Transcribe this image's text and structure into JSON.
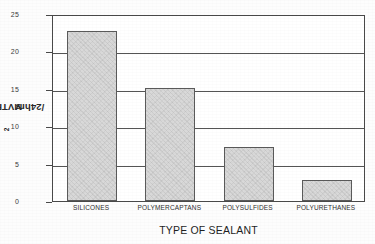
{
  "chart_data": {
    "type": "bar",
    "title": "",
    "subtitle": "",
    "xlabel": "TYPE OF SEALANT",
    "ylabel": "MVTR g/m2/24hrs",
    "ylabel_parts": {
      "main": "MVTR g/m",
      "superscript": "2",
      "tail": "/24hrs"
    },
    "categories": [
      "SILICONES",
      "POLYMERCAPTANS",
      "POLYSULFIDES",
      "POLYURETHANES"
    ],
    "values": [
      22.7,
      15.1,
      7.2,
      2.8
    ],
    "ylim": [
      0,
      25
    ],
    "yticks": [
      0,
      5,
      10,
      15,
      20,
      25
    ],
    "ytick_labels": [
      "0",
      "5",
      "10",
      "15",
      "20",
      "25"
    ],
    "grid": true,
    "grid_axis": "y",
    "legend": false,
    "legend_position": "none",
    "bar_color": "#d9d9d9",
    "bar_edge_color": "#5a5a5a",
    "axis_color": "#4a4a4a",
    "background_color": "#ffffff"
  }
}
